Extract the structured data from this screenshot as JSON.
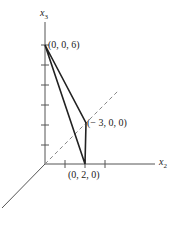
{
  "axes": {
    "x3_label": "x",
    "x3_sub": "3",
    "x2_label": "x",
    "x2_sub": "2"
  },
  "points": {
    "p1": "(0, 0, 6)",
    "p2": "(− 3, 0, 0)",
    "p3": "(0, 2, 0)"
  },
  "colors": {
    "line": "#222222",
    "axis": "#555555",
    "dashed": "#888888"
  }
}
